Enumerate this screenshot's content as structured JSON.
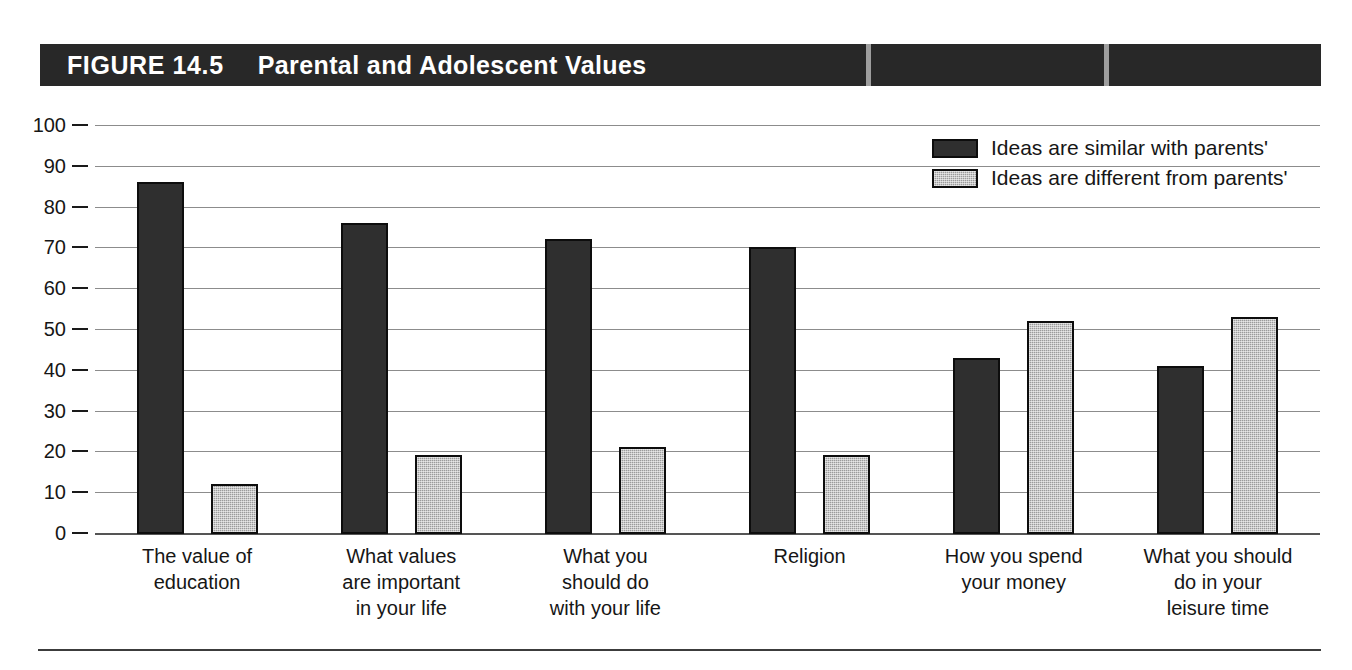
{
  "figure": {
    "number": "FIGURE 14.5",
    "title": "Parental and Adolescent Values"
  },
  "legend": {
    "position": "top-right",
    "entries": [
      {
        "label": "Ideas are similar with parents'",
        "swatch": "dark-swatch-icon",
        "color": "#2f2f2f"
      },
      {
        "label": "Ideas are different from parents'",
        "swatch": "light-swatch-icon",
        "color": "#9b9b9b"
      }
    ]
  },
  "axis": {
    "y_ticks": [
      "100",
      "90",
      "80",
      "70",
      "60",
      "50",
      "40",
      "30",
      "20",
      "10",
      "0"
    ]
  },
  "colors": {
    "banner": "#282828",
    "series_similar": "#2f2f2f",
    "series_different": "#9b9b9b",
    "gridline": "#8c8c8c",
    "text": "#161616"
  },
  "chart_data": {
    "type": "bar",
    "title": "Parental and Adolescent Values",
    "xlabel": "",
    "ylabel": "",
    "ylim": [
      0,
      100
    ],
    "ytick_step": 10,
    "grid": true,
    "legend_position": "top-right",
    "categories": [
      "The value of\neducation",
      "What values\nare important\nin your life",
      "What you\nshould do\nwith your life",
      "Religion",
      "How you spend\nyour money",
      "What you should\ndo in your\nleisure time"
    ],
    "series": [
      {
        "name": "Ideas are similar with parents'",
        "color": "#2f2f2f",
        "values": [
          86,
          76,
          72,
          70,
          43,
          41
        ]
      },
      {
        "name": "Ideas are different from parents'",
        "color": "#9b9b9b",
        "values": [
          12,
          19,
          21,
          19,
          52,
          53
        ]
      }
    ]
  }
}
